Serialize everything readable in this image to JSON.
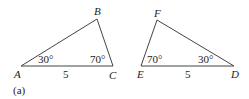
{
  "figure_label": "(a)",
  "triangles": [
    {
      "name": "ABC",
      "vertices": {
        "A": "A",
        "B": "B",
        "C": "C"
      },
      "angles": {
        "A": "30°",
        "C": "70°"
      },
      "side_AC": "5"
    },
    {
      "name": "DEF",
      "vertices": {
        "D": "D",
        "E": "E",
        "F": "F"
      },
      "angles": {
        "E": "70°",
        "D": "30°"
      },
      "side_ED": "5"
    }
  ]
}
